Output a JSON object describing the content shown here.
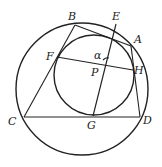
{
  "diagram": {
    "type": "geometry",
    "colors": {
      "stroke": "#222222",
      "background": "#ffffff"
    },
    "outer_circle": {
      "cx": 82,
      "cy": 89,
      "r": 66
    },
    "inner_circle": {
      "cx": 94,
      "cy": 75,
      "r": 40
    },
    "points": {
      "A": {
        "label": "A",
        "x": 131,
        "y": 46,
        "lx": 134,
        "ly": 43
      },
      "B": {
        "label": "B",
        "x": 75,
        "y": 25,
        "lx": 68,
        "ly": 20
      },
      "C": {
        "label": "C",
        "x": 24,
        "y": 117,
        "lx": 8,
        "ly": 125
      },
      "D": {
        "label": "D",
        "x": 140,
        "y": 117,
        "lx": 143,
        "ly": 124
      },
      "E": {
        "label": "E",
        "x": 116,
        "y": 24,
        "lx": 112,
        "ly": 20
      },
      "F": {
        "label": "F",
        "x": 57,
        "y": 57,
        "lx": 46,
        "ly": 60
      },
      "G": {
        "label": "G",
        "x": 93,
        "y": 116,
        "lx": 87,
        "ly": 129
      },
      "H": {
        "label": "H",
        "x": 133,
        "y": 70,
        "lx": 134,
        "ly": 74
      },
      "P": {
        "label": "P",
        "x": 110,
        "y": 63,
        "lx": 91,
        "ly": 76
      }
    },
    "angle_label": {
      "text": "α",
      "x": 94,
      "y": 59
    },
    "segments": [
      [
        "B",
        "C"
      ],
      [
        "C",
        "D"
      ],
      [
        "D",
        "A"
      ],
      [
        "A",
        "B"
      ],
      [
        "F",
        "H"
      ],
      [
        "E",
        "G"
      ]
    ]
  }
}
